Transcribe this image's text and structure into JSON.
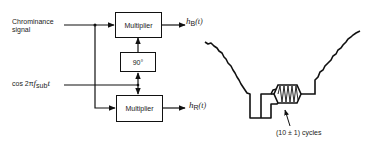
{
  "block_diagram": {
    "inputs": {
      "chrominance_line1": "Chrominance",
      "chrominance_line2": "signal",
      "carrier_prefix": "cos 2π",
      "carrier_f": "f",
      "carrier_sub": "sub",
      "carrier_t": "t"
    },
    "blocks": {
      "top_multiplier": "Multiplier",
      "phase_shift": "90°",
      "bottom_multiplier": "Multiplier"
    },
    "outputs": {
      "top_h": "h",
      "top_sub": "B",
      "top_arg": "(t)",
      "bottom_h": "h",
      "bottom_sub": "R",
      "bottom_arg": "(t)"
    }
  },
  "waveform": {
    "annotation": "(10 ± 1) cycles"
  },
  "colors": {
    "line": "#111111",
    "text": "#222222",
    "background": "#ffffff"
  }
}
